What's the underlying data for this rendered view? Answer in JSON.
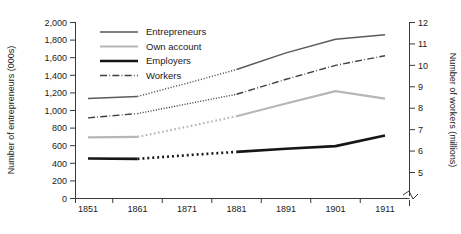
{
  "chart_data": {
    "type": "line",
    "title": "",
    "x": [
      1851,
      1861,
      1871,
      1881,
      1891,
      1901,
      1911
    ],
    "categories": [
      "1851",
      "1861",
      "1871",
      "1881",
      "1891",
      "1901",
      "1911"
    ],
    "xlabel": "",
    "ylabel": "Number of entrepreneurs (000s)",
    "y2label": "Number of workers (millions)",
    "ylim": [
      0,
      2000
    ],
    "y2lim": [
      5,
      12
    ],
    "yticks": [
      "0",
      "200",
      "400",
      "600",
      "800",
      "1,000",
      "1,200",
      "1,400",
      "1,600",
      "1,800",
      "2,000"
    ],
    "y2ticks": [
      "5",
      "6",
      "7",
      "8",
      "9",
      "10",
      "11",
      "12"
    ],
    "grid": false,
    "legend_position": "top-left-inside",
    "y2_axis_break": true,
    "dotted_interval": [
      1861,
      1881
    ],
    "series": [
      {
        "name": "Entrepreneurs",
        "axis": "left",
        "color": "#5a5a5a",
        "width": 1.5,
        "style": "solid",
        "values": [
          1135,
          1160,
          1310,
          1465,
          1655,
          1810,
          1860
        ]
      },
      {
        "name": "Own account",
        "axis": "left",
        "color": "#b6b6b6",
        "width": 2.2,
        "style": "solid",
        "values": [
          695,
          700,
          815,
          935,
          1080,
          1220,
          1135
        ]
      },
      {
        "name": "Employers",
        "axis": "left",
        "color": "#161616",
        "width": 2.6,
        "style": "solid",
        "values": [
          455,
          450,
          492,
          530,
          565,
          595,
          715
        ]
      },
      {
        "name": "Workers",
        "axis": "right",
        "color": "#404040",
        "width": 1.4,
        "style": "dashdot",
        "values": [
          7.55,
          7.75,
          8.2,
          8.65,
          9.35,
          10.0,
          10.45
        ]
      }
    ]
  },
  "legend": {
    "items": [
      {
        "label": "Entrepreneurs"
      },
      {
        "label": "Own account"
      },
      {
        "label": "Employers"
      },
      {
        "label": "Workers"
      }
    ]
  },
  "axes": {
    "left_title": "Number of entrepreneurs (000s)",
    "right_title": "Number of workers (millions)"
  }
}
